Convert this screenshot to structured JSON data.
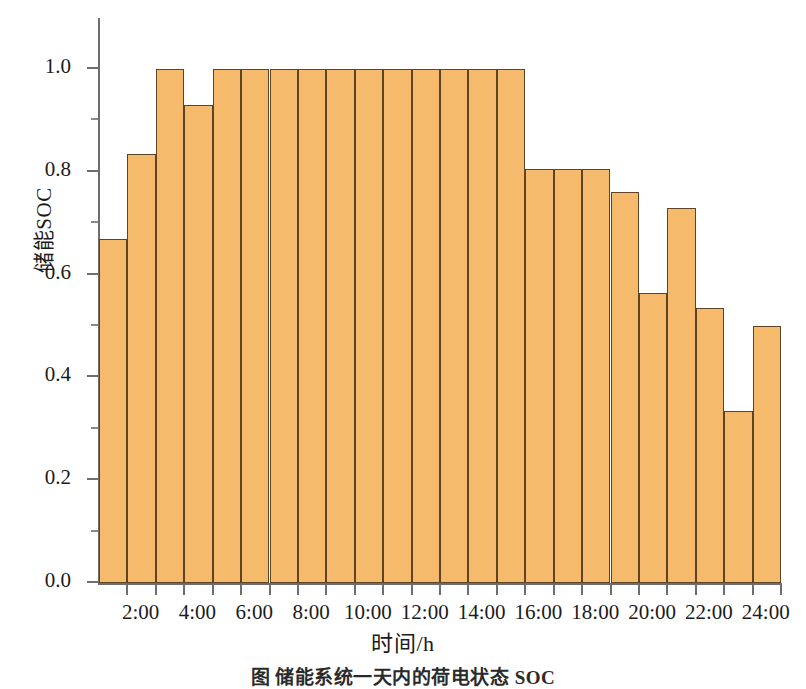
{
  "chart_data": {
    "type": "bar",
    "title": "",
    "xlabel": "时间/h",
    "ylabel": "储能SOC",
    "ylim": [
      0.0,
      1.0
    ],
    "xlim": [
      0,
      24
    ],
    "grid": false,
    "legend": null,
    "bar_color": "#f6ba6c",
    "bar_edge_color": "#5d4424",
    "axis_color": "#6e6e6e",
    "y_ticks_major": [
      "0.0",
      "0.2",
      "0.4",
      "0.6",
      "0.8",
      "1.0"
    ],
    "y_ticks_major_values": [
      0.0,
      0.2,
      0.4,
      0.6,
      0.8,
      1.0
    ],
    "y_ticks_minor_values": [
      0.1,
      0.3,
      0.5,
      0.7,
      0.9,
      1.1
    ],
    "x_tick_labels": [
      "2:00",
      "4:00",
      "6:00",
      "8:00",
      "10:00",
      "12:00",
      "14:00",
      "16:00",
      "18:00",
      "20:00",
      "22:00",
      "24:00"
    ],
    "x_tick_hours": [
      2,
      4,
      6,
      8,
      10,
      12,
      14,
      16,
      18,
      20,
      22,
      24
    ],
    "categories": [
      "1:00",
      "2:00",
      "3:00",
      "4:00",
      "5:00",
      "6:00",
      "7:00",
      "8:00",
      "9:00",
      "10:00",
      "11:00",
      "12:00",
      "13:00",
      "14:00",
      "15:00",
      "16:00",
      "17:00",
      "18:00",
      "19:00",
      "20:00",
      "21:00",
      "22:00",
      "23:00",
      "24:00"
    ],
    "values": [
      0.67,
      0.835,
      1.0,
      0.93,
      1.0,
      1.0,
      1.0,
      1.0,
      1.0,
      1.0,
      1.0,
      1.0,
      1.0,
      1.0,
      1.0,
      0.805,
      0.805,
      0.805,
      0.76,
      0.565,
      0.73,
      0.535,
      0.335,
      0.5
    ]
  },
  "caption": "图  储能系统一天内的荷电状态 SOC"
}
